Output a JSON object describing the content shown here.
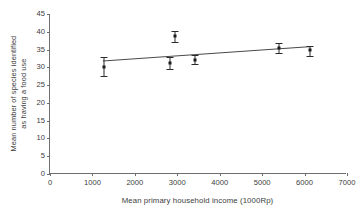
{
  "chart_data": {
    "type": "scatter",
    "title": "",
    "xlabel": "Mean primary household income (1000Rp)",
    "ylabel_line1": "Mean number of species identified",
    "ylabel_line2": "as having a food use",
    "xlim": [
      0,
      7000
    ],
    "ylim": [
      0,
      45
    ],
    "xticks": [
      0,
      1000,
      2000,
      3000,
      4000,
      5000,
      6000,
      7000
    ],
    "yticks": [
      0,
      5,
      10,
      15,
      20,
      25,
      30,
      35,
      40,
      45
    ],
    "xtick_labels": [
      "0",
      "1000",
      "2000",
      "3000",
      "4000",
      "5000",
      "6000",
      "7000"
    ],
    "ytick_labels": [
      "0",
      "5",
      "10",
      "15",
      "20",
      "25",
      "30",
      "35",
      "40",
      "45"
    ],
    "grid": false,
    "legend": "none",
    "marker_color": "#1a1a1a",
    "line_color": "#4a4a4a",
    "axis_color": "#6f6f6f",
    "points": [
      {
        "x": 1280,
        "y": 30.0,
        "err_low": 27.5,
        "err_high": 33.0
      },
      {
        "x": 2820,
        "y": 31.2,
        "err_low": 29.4,
        "err_high": 33.0
      },
      {
        "x": 2950,
        "y": 38.7,
        "err_low": 37.1,
        "err_high": 40.3
      },
      {
        "x": 3420,
        "y": 32.2,
        "err_low": 30.9,
        "err_high": 33.4
      },
      {
        "x": 5400,
        "y": 35.3,
        "err_low": 33.9,
        "err_high": 36.9
      },
      {
        "x": 6120,
        "y": 34.8,
        "err_low": 33.3,
        "err_high": 36.1
      }
    ],
    "trendline": {
      "x0": 1250,
      "y0": 31.7,
      "x1": 6200,
      "y1": 35.8
    }
  }
}
